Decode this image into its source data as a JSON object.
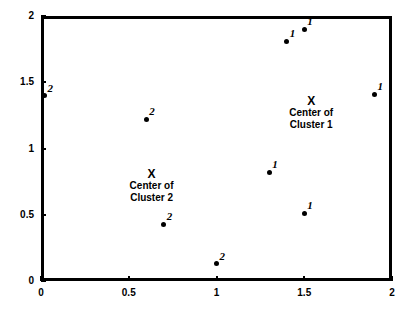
{
  "chart_data": {
    "type": "scatter",
    "title": "",
    "xlabel": "",
    "ylabel": "",
    "xlim": [
      0,
      2
    ],
    "ylim": [
      0,
      2
    ],
    "xticks": [
      "0",
      "0.5",
      "1",
      "1.5",
      "2"
    ],
    "xtick_values": [
      0,
      0.5,
      1,
      1.5,
      2
    ],
    "yticks": [
      "0",
      "0.5",
      "1",
      "1.5",
      "2"
    ],
    "ytick_values": [
      0,
      0.5,
      1,
      1.5,
      2
    ],
    "grid": false,
    "legend": "none",
    "frame": true,
    "series": [
      {
        "name": "Cluster 1",
        "marker_label": "1",
        "points": [
          {
            "x": 1.4,
            "y": 1.81,
            "label": "1"
          },
          {
            "x": 1.5,
            "y": 1.9,
            "label": "1"
          },
          {
            "x": 1.9,
            "y": 1.41,
            "label": "1"
          },
          {
            "x": 1.3,
            "y": 0.82,
            "label": "1"
          },
          {
            "x": 1.5,
            "y": 0.51,
            "label": "1"
          }
        ]
      },
      {
        "name": "Cluster 2",
        "marker_label": "2",
        "points": [
          {
            "x": 0.02,
            "y": 1.4,
            "label": "2"
          },
          {
            "x": 0.6,
            "y": 1.22,
            "label": "2"
          },
          {
            "x": 0.7,
            "y": 0.43,
            "label": "2"
          },
          {
            "x": 1.0,
            "y": 0.13,
            "label": "2"
          }
        ]
      }
    ],
    "annotations": [
      {
        "name": "center-of-cluster-1",
        "marker": "X",
        "x": 1.54,
        "y": 1.36,
        "lines": [
          "Center of",
          "Cluster 1"
        ]
      },
      {
        "name": "center-of-cluster-2",
        "marker": "X",
        "x": 0.63,
        "y": 0.81,
        "lines": [
          "Center of",
          "Cluster 2"
        ]
      }
    ]
  }
}
